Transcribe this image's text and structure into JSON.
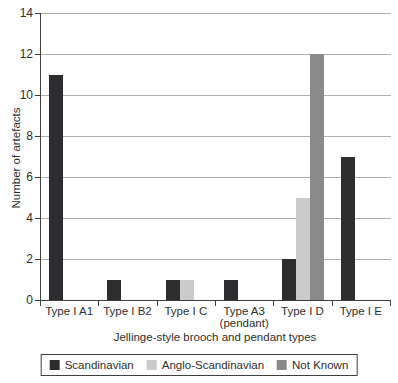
{
  "chart_data": {
    "type": "bar",
    "title": "",
    "xlabel": "Jellinge-style brooch and pendant types",
    "ylabel": "Number of artefacts",
    "ylim": [
      0,
      14
    ],
    "yticks": [
      0,
      2,
      4,
      6,
      8,
      10,
      12,
      14
    ],
    "grid": true,
    "legend_position": "bottom",
    "categories": [
      "Type I A1",
      "Type I B2",
      "Type I C",
      "Type A3\n(pendant)",
      "Type I D",
      "Type I E"
    ],
    "series": [
      {
        "name": "Scandinavian",
        "color": "#2d2d2f",
        "values": [
          11,
          1,
          1,
          1,
          2,
          7
        ]
      },
      {
        "name": "Anglo-Scandinavian",
        "color": "#cbcbcb",
        "values": [
          0,
          0,
          1,
          0,
          5,
          0
        ]
      },
      {
        "name": "Not Known",
        "color": "#8a8a8a",
        "values": [
          0,
          0,
          0,
          0,
          12,
          0
        ]
      }
    ]
  }
}
